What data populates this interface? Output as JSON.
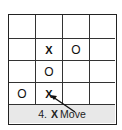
{
  "board": {
    "rows": 4,
    "cols": 4,
    "cells": [
      [
        "",
        "",
        "",
        ""
      ],
      [
        "",
        "X",
        "O",
        ""
      ],
      [
        "",
        "O",
        "",
        ""
      ],
      [
        "O",
        "X",
        "",
        ""
      ]
    ]
  },
  "caption": {
    "number": "4.",
    "mark": "X",
    "label": "Move"
  },
  "arrow": {
    "from_caption_to_cell": "row 4, col 2"
  },
  "colors": {
    "grid_line": "#333333",
    "caption_background": "#e8e8e8",
    "text": "#111111"
  }
}
